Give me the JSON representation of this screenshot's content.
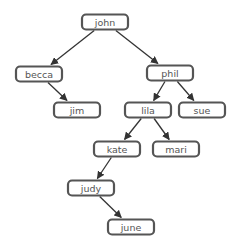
{
  "diagram": {
    "type": "binary-tree",
    "nodes": [
      {
        "id": "john",
        "label": "john"
      },
      {
        "id": "becca",
        "label": "becca"
      },
      {
        "id": "phil",
        "label": "phil"
      },
      {
        "id": "jim",
        "label": "jim"
      },
      {
        "id": "lila",
        "label": "lila"
      },
      {
        "id": "sue",
        "label": "sue"
      },
      {
        "id": "kate",
        "label": "kate"
      },
      {
        "id": "mari",
        "label": "mari"
      },
      {
        "id": "judy",
        "label": "judy"
      },
      {
        "id": "june",
        "label": "june"
      }
    ],
    "edges": [
      {
        "from": "john",
        "to": "becca"
      },
      {
        "from": "john",
        "to": "phil"
      },
      {
        "from": "becca",
        "to": "jim"
      },
      {
        "from": "phil",
        "to": "lila"
      },
      {
        "from": "phil",
        "to": "sue"
      },
      {
        "from": "lila",
        "to": "kate"
      },
      {
        "from": "lila",
        "to": "mari"
      },
      {
        "from": "kate",
        "to": "judy"
      },
      {
        "from": "judy",
        "to": "june"
      }
    ]
  }
}
